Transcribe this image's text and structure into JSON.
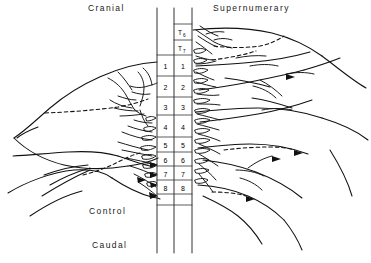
{
  "figure": {
    "title_labels": {
      "cranial": "Cranial",
      "supernumerary": "Supernumerary",
      "control": "Control",
      "caudal": "Caudal"
    },
    "vertebral_column": {
      "top_segments": [
        {
          "letter": "T",
          "subscript": "6"
        },
        {
          "letter": "T",
          "subscript": "7"
        }
      ],
      "left_column_numbers": [
        "1",
        "2",
        "3",
        "4",
        "5",
        "6",
        "7",
        "8"
      ],
      "right_column_numbers": [
        "1",
        "2",
        "3",
        "4",
        "5",
        "6",
        "7",
        "8"
      ]
    },
    "colors": {
      "ink": "#000000",
      "background": "#ffffff",
      "grid": "#444444"
    }
  }
}
